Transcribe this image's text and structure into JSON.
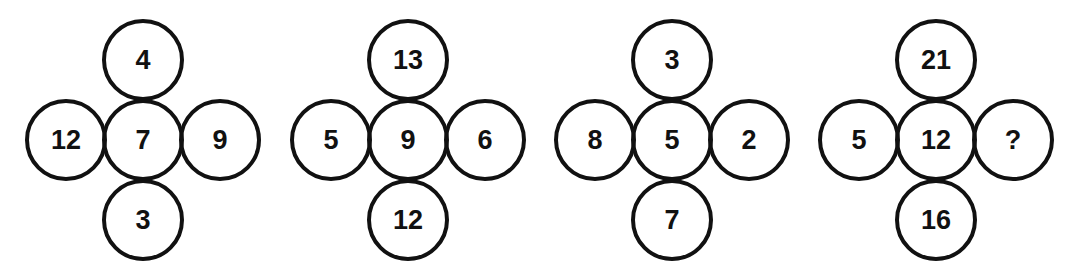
{
  "colors": {
    "stroke": "#111111",
    "text": "#111111",
    "background": "#ffffff"
  },
  "crosses": [
    {
      "top": "4",
      "left": "12",
      "center": "7",
      "right": "9",
      "bottom": "3"
    },
    {
      "top": "13",
      "left": "5",
      "center": "9",
      "right": "6",
      "bottom": "12"
    },
    {
      "top": "3",
      "left": "8",
      "center": "5",
      "right": "2",
      "bottom": "7"
    },
    {
      "top": "21",
      "left": "5",
      "center": "12",
      "right": "?",
      "bottom": "16"
    }
  ]
}
